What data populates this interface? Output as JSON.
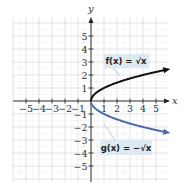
{
  "chart_data": {
    "type": "line",
    "title": "",
    "xlabel": "x",
    "ylabel": "y",
    "xlim": [
      -5.9,
      6.0
    ],
    "ylim": [
      -6.2,
      6.4
    ],
    "grid": true,
    "x_ticks": [
      -5,
      -4,
      -3,
      -2,
      -1,
      1,
      2,
      3,
      4,
      5
    ],
    "x_tick_labels": [
      "−5",
      "−4",
      "−3",
      "−2",
      "−1",
      "1",
      "2",
      "3",
      "4",
      "5"
    ],
    "y_ticks": [
      5,
      4,
      3,
      2,
      1,
      -1,
      -2,
      -3,
      -4,
      -5
    ],
    "y_tick_labels": [
      "5",
      "4",
      "3",
      "2",
      "1",
      "−1",
      "−2",
      "−3",
      "−4",
      "−5"
    ],
    "series": [
      {
        "name": "f(x) = √x",
        "color": "#111111",
        "x": [
          0,
          0.25,
          1,
          2,
          3,
          4,
          5,
          5.8
        ],
        "y": [
          0,
          0.5,
          1,
          1.414,
          1.732,
          2,
          2.236,
          2.408
        ]
      },
      {
        "name": "g(x) = −√x",
        "color": "#4a6aa8",
        "x": [
          0,
          0.25,
          1,
          2,
          3,
          4,
          5,
          5.8
        ],
        "y": [
          0,
          -0.5,
          -1,
          -1.414,
          -1.732,
          -2,
          -2.236,
          -2.408
        ]
      }
    ],
    "annotations": [
      {
        "text": "f(x) = √x",
        "points_to": "upper curve"
      },
      {
        "text": "g(x) = −√x",
        "points_to": "lower curve"
      }
    ]
  },
  "labels": {
    "x_axis": "x",
    "y_axis": "y",
    "f_label": "f(x) = √x",
    "g_label": "g(x) = −√x"
  },
  "colors": {
    "grid": "#dcdcdc",
    "axis": "#222222",
    "f_curve": "#111111",
    "g_curve": "#4a6aa8",
    "label_box": "#dde9f0"
  }
}
